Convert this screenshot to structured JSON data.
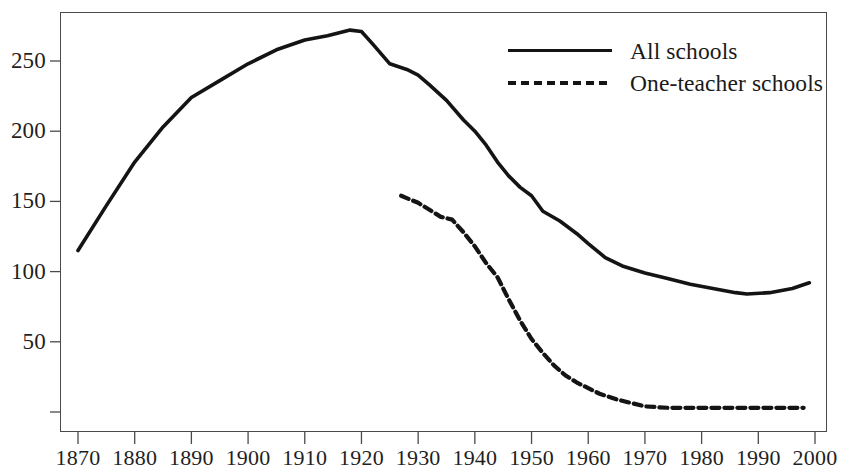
{
  "chart_data": {
    "type": "line",
    "title": "",
    "subtitle": "",
    "xlabel": "",
    "ylabel": "",
    "grid": false,
    "legend_position": "top-right",
    "xlim": [
      1865,
      2002
    ],
    "ylim": [
      0,
      285
    ],
    "xticks": [
      1870,
      1880,
      1890,
      1900,
      1910,
      1920,
      1930,
      1940,
      1950,
      1960,
      1970,
      1980,
      1990,
      2000
    ],
    "xtick_labels": [
      "1870",
      "1880",
      "1890",
      "1900",
      "1910",
      "1920",
      "1930",
      "1940",
      "1950",
      "1960",
      "1970",
      "1980",
      "1990",
      "2000"
    ],
    "yticks": [
      0,
      50,
      100,
      150,
      200,
      250
    ],
    "ytick_labels": [
      "",
      "50",
      "100",
      "150",
      "200",
      "250"
    ],
    "series": [
      {
        "name": "All schools",
        "style": "solid",
        "color": "#141414",
        "x": [
          1870,
          1875,
          1880,
          1885,
          1890,
          1895,
          1900,
          1905,
          1910,
          1914,
          1918,
          1920,
          1922,
          1925,
          1928,
          1930,
          1932,
          1935,
          1938,
          1940,
          1942,
          1944,
          1946,
          1948,
          1950,
          1952,
          1955,
          1958,
          1960,
          1963,
          1966,
          1970,
          1974,
          1978,
          1982,
          1986,
          1988,
          1992,
          1996,
          1999
        ],
        "values": [
          115,
          147,
          178,
          203,
          224,
          236,
          248,
          258,
          265,
          268,
          272,
          271,
          262,
          248,
          244,
          240,
          233,
          222,
          208,
          200,
          190,
          178,
          168,
          160,
          154,
          143,
          136,
          127,
          120,
          110,
          104,
          99,
          95,
          91,
          88,
          85,
          84,
          85,
          88,
          92
        ]
      },
      {
        "name": "One-teacher schools",
        "style": "dashed",
        "color": "#141414",
        "x": [
          1927,
          1930,
          1932,
          1934,
          1936,
          1938,
          1940,
          1942,
          1944,
          1946,
          1948,
          1950,
          1952,
          1954,
          1956,
          1958,
          1960,
          1962,
          1965,
          1968,
          1970,
          1974,
          1978,
          1982,
          1986,
          1990,
          1994,
          1998
        ],
        "values": [
          154,
          149,
          144,
          139,
          137,
          128,
          118,
          106,
          96,
          80,
          65,
          52,
          42,
          33,
          26,
          21,
          17,
          13,
          9,
          6,
          4,
          3,
          3,
          3,
          3,
          3,
          3,
          3
        ]
      }
    ]
  },
  "legend": {
    "items": [
      {
        "label": "All schools",
        "style": "solid"
      },
      {
        "label": "One-teacher schools",
        "style": "dashed"
      }
    ]
  },
  "colors": {
    "line": "#141414",
    "axis": "#4a4a4a",
    "text": "#1a1a1a",
    "background": "#ffffff"
  }
}
